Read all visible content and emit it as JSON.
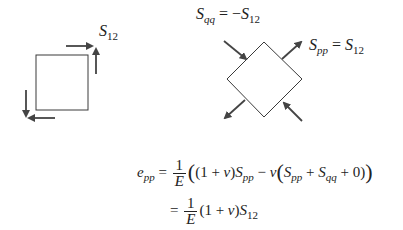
{
  "labels": {
    "left_shear": {
      "base": "S",
      "sub": "12"
    },
    "sqq": {
      "base": "S",
      "sub": "qq",
      "eq": "=",
      "rhs_sign": "−",
      "rhs_base": "S",
      "rhs_sub": "12"
    },
    "spp": {
      "base": "S",
      "sub": "pp",
      "eq": "=",
      "rhs_base": "S",
      "rhs_sub": "12"
    }
  },
  "equation": {
    "line1": {
      "lhs_base": "e",
      "lhs_sub": "pp",
      "eq": "=",
      "frac_num": "1",
      "frac_den": "E",
      "open_big": "(",
      "term1": "(1 + ",
      "nu": "v",
      "term1_close": ")",
      "spp_base": "S",
      "spp_sub": "pp",
      "minus": " − ",
      "nu2": "v",
      "open2": "(",
      "s1_base": "S",
      "s1_sub": "pp",
      "plus": " + ",
      "s2_base": "S",
      "s2_sub": "qq",
      "tail": " + 0)",
      "close_big": ")"
    },
    "line2": {
      "eq": "=",
      "frac_num": "1",
      "frac_den": "E",
      "term": "(1 + ",
      "nu": "v",
      "term_close": ")",
      "s_base": "S",
      "s_sub": "12"
    }
  },
  "colors": {
    "stroke": "#3a3a3a",
    "arrow": "#444444",
    "text": "#222222"
  }
}
